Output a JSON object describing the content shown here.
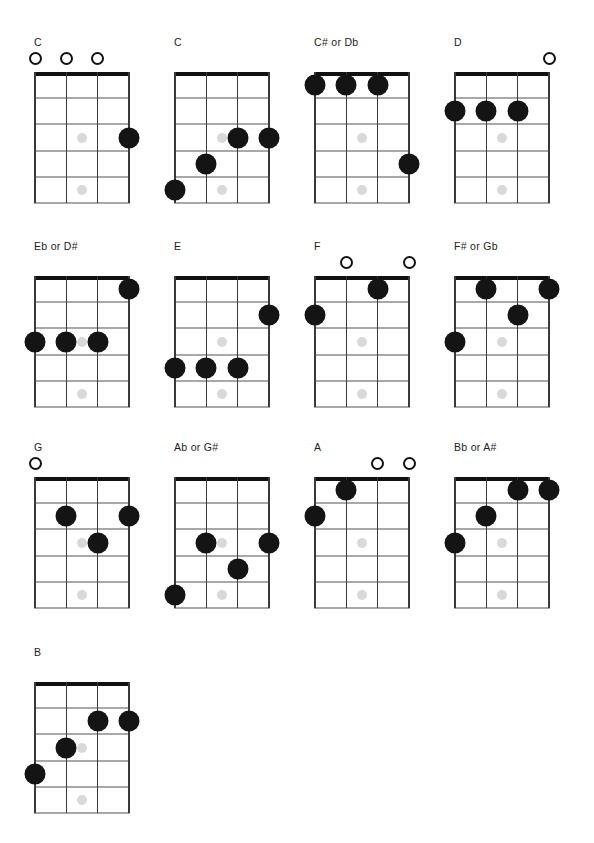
{
  "page": {
    "background_color": "#ffffff",
    "dot_color": "#141414",
    "marker_color": "#d9d9d9",
    "nut_color": "#111111",
    "fret_color": "#a8a8a8",
    "string_color": "#3a3a3a"
  },
  "diagram_spec": {
    "strings": 4,
    "frets": 5,
    "inlay_markers": [
      {
        "fret": 3,
        "between_strings": [
          2,
          3
        ]
      },
      {
        "fret": 5,
        "between_strings": [
          2,
          3
        ]
      }
    ],
    "open_symbol": "O",
    "grid_width": 96,
    "grid_height": 131
  },
  "layout": {
    "columns": 4,
    "rows": 4,
    "column_x": [
      28,
      168,
      308,
      448
    ],
    "row_y": [
      36,
      240,
      441,
      646
    ]
  },
  "chords": [
    {
      "name": "C",
      "id": "chord-c-open",
      "open_strings": [
        1,
        2,
        3
      ],
      "dots": [
        {
          "string": 4,
          "fret": 3
        }
      ]
    },
    {
      "name": "C",
      "id": "chord-c-barre",
      "open_strings": [],
      "dots": [
        {
          "string": 1,
          "fret": 5
        },
        {
          "string": 2,
          "fret": 4
        },
        {
          "string": 3,
          "fret": 3
        },
        {
          "string": 4,
          "fret": 3
        }
      ]
    },
    {
      "name": "C# or Db",
      "id": "chord-csharp-db",
      "open_strings": [],
      "dots": [
        {
          "string": 1,
          "fret": 1
        },
        {
          "string": 2,
          "fret": 1
        },
        {
          "string": 3,
          "fret": 1
        },
        {
          "string": 4,
          "fret": 4
        }
      ]
    },
    {
      "name": "D",
      "id": "chord-d",
      "open_strings": [
        4
      ],
      "dots": [
        {
          "string": 1,
          "fret": 2
        },
        {
          "string": 2,
          "fret": 2
        },
        {
          "string": 3,
          "fret": 2
        }
      ]
    },
    {
      "name": "Eb or D#",
      "id": "chord-eflat-dsharp",
      "open_strings": [],
      "dots": [
        {
          "string": 1,
          "fret": 3
        },
        {
          "string": 2,
          "fret": 3
        },
        {
          "string": 3,
          "fret": 3
        },
        {
          "string": 4,
          "fret": 1
        }
      ]
    },
    {
      "name": "E",
      "id": "chord-e",
      "open_strings": [],
      "dots": [
        {
          "string": 1,
          "fret": 4
        },
        {
          "string": 2,
          "fret": 4
        },
        {
          "string": 3,
          "fret": 4
        },
        {
          "string": 4,
          "fret": 2
        }
      ]
    },
    {
      "name": "F",
      "id": "chord-f",
      "open_strings": [
        2,
        4
      ],
      "dots": [
        {
          "string": 1,
          "fret": 2
        },
        {
          "string": 3,
          "fret": 1
        }
      ]
    },
    {
      "name": "F# or Gb",
      "id": "chord-fsharp-gb",
      "open_strings": [],
      "dots": [
        {
          "string": 1,
          "fret": 3
        },
        {
          "string": 2,
          "fret": 1
        },
        {
          "string": 3,
          "fret": 2
        },
        {
          "string": 4,
          "fret": 1
        }
      ]
    },
    {
      "name": "G",
      "id": "chord-g",
      "open_strings": [
        1
      ],
      "dots": [
        {
          "string": 2,
          "fret": 2
        },
        {
          "string": 3,
          "fret": 3
        },
        {
          "string": 4,
          "fret": 2
        }
      ]
    },
    {
      "name": "Ab or G#",
      "id": "chord-aflat-gsharp",
      "open_strings": [],
      "dots": [
        {
          "string": 1,
          "fret": 5
        },
        {
          "string": 2,
          "fret": 3
        },
        {
          "string": 3,
          "fret": 4
        },
        {
          "string": 4,
          "fret": 3
        }
      ]
    },
    {
      "name": "A",
      "id": "chord-a",
      "open_strings": [
        3,
        4
      ],
      "dots": [
        {
          "string": 1,
          "fret": 2
        },
        {
          "string": 2,
          "fret": 1
        }
      ]
    },
    {
      "name": "Bb or A#",
      "id": "chord-bflat-asharp",
      "open_strings": [],
      "dots": [
        {
          "string": 1,
          "fret": 3
        },
        {
          "string": 2,
          "fret": 2
        },
        {
          "string": 3,
          "fret": 1
        },
        {
          "string": 4,
          "fret": 1
        }
      ]
    },
    {
      "name": "B",
      "id": "chord-b",
      "open_strings": [],
      "dots": [
        {
          "string": 1,
          "fret": 4
        },
        {
          "string": 2,
          "fret": 3
        },
        {
          "string": 3,
          "fret": 2
        },
        {
          "string": 4,
          "fret": 2
        }
      ]
    }
  ]
}
